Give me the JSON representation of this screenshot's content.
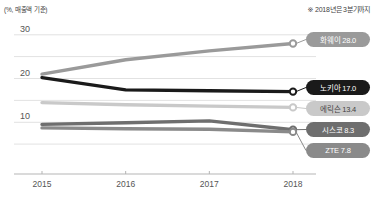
{
  "header": {
    "unit_note": "(%, 매출액 기준)",
    "footnote": "※ 2018년은 3분기까지"
  },
  "chart_data": {
    "type": "line",
    "title": "",
    "subtitle": "",
    "xlabel": "",
    "ylabel": "(%, 매출액 기준)",
    "x": [
      "2015",
      "2016",
      "2017",
      "2018"
    ],
    "xtick_labels": [
      "2015",
      "2016",
      "2017",
      "2018"
    ],
    "ytick_labels": [
      "10",
      "20",
      "30"
    ],
    "ytick_values": [
      10,
      20,
      30
    ],
    "ylim": [
      0,
      32
    ],
    "gridline_values": [
      5,
      10,
      15,
      20,
      25,
      30
    ],
    "grid": true,
    "legend_position": "right-inline",
    "annotation": "※ 2018년은 3분기까지",
    "series": [
      {
        "name": "화웨이",
        "label": "화웨이 28.0",
        "final_value": "28.0",
        "color": "#9a9a9a",
        "text_color": "#ffffff",
        "values": [
          21.0,
          24.3,
          26.3,
          28.0
        ]
      },
      {
        "name": "노키아",
        "label": "노키아 17.0",
        "final_value": "17.0",
        "color": "#1a1a1a",
        "text_color": "#ffffff",
        "values": [
          20.2,
          17.4,
          17.2,
          17.0
        ]
      },
      {
        "name": "에릭슨",
        "label": "에릭슨 13.4",
        "final_value": "13.4",
        "color": "#c9c9c9",
        "text_color": "#3f3f3f",
        "values": [
          14.5,
          14.0,
          13.7,
          13.4
        ]
      },
      {
        "name": "시스코",
        "label": "시스코 8.3",
        "final_value": "8.3",
        "color": "#6e6e6e",
        "text_color": "#ffffff",
        "values": [
          9.5,
          9.9,
          10.3,
          8.3
        ]
      },
      {
        "name": "ZTE",
        "label": "ZTE 7.8",
        "final_value": "7.8",
        "color": "#8a8a8a",
        "text_color": "#ffffff",
        "values": [
          8.7,
          8.5,
          8.4,
          7.8
        ]
      }
    ]
  },
  "legend": {
    "items": [
      {
        "label": "화웨이 28.0"
      },
      {
        "label": "노키아 17.0"
      },
      {
        "label": "에릭슨 13.4"
      },
      {
        "label": "시스코 8.3"
      },
      {
        "label": "ZTE 7.8"
      }
    ]
  }
}
